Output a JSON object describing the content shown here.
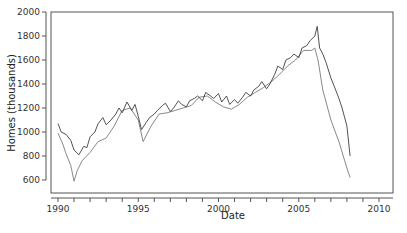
{
  "chart_data": {
    "type": "line",
    "title": "",
    "xlabel": "Date",
    "ylabel": "Homes (thousands)",
    "xlim": [
      1989.6,
      2010.9
    ],
    "ylim": [
      490,
      2000
    ],
    "grid": false,
    "legend": null,
    "x_ticks": [
      "1990",
      "1995",
      "2000",
      "2005",
      "2010"
    ],
    "y_ticks": [
      "600",
      "800",
      "1000",
      "1200",
      "1400",
      "1600",
      "1800",
      "2000"
    ],
    "series": [
      {
        "name": "series-dark",
        "color": "#404040",
        "x": [
          1990.0,
          1990.2,
          1990.5,
          1990.8,
          1991.0,
          1991.3,
          1991.6,
          1991.8,
          1992.0,
          1992.3,
          1992.5,
          1992.8,
          1993.0,
          1993.3,
          1993.6,
          1993.8,
          1994.0,
          1994.3,
          1994.6,
          1994.8,
          1995.0,
          1995.2,
          1995.5,
          1995.7,
          1996.0,
          1996.2,
          1996.5,
          1996.7,
          1997.0,
          1997.2,
          1997.5,
          1997.7,
          1998.0,
          1998.2,
          1998.5,
          1998.7,
          1999.0,
          1999.2,
          1999.5,
          1999.7,
          2000.0,
          2000.2,
          2000.5,
          2000.7,
          2001.0,
          2001.2,
          2001.5,
          2001.7,
          2002.0,
          2002.2,
          2002.5,
          2002.7,
          2003.0,
          2003.2,
          2003.5,
          2003.7,
          2004.0,
          2004.2,
          2004.5,
          2004.7,
          2005.0,
          2005.2,
          2005.5,
          2005.7,
          2006.0,
          2006.15,
          2006.3,
          2006.5,
          2006.7,
          2007.0,
          2007.3,
          2007.5,
          2007.7,
          2008.0,
          2008.2
        ],
        "values": [
          1070,
          1000,
          980,
          930,
          850,
          810,
          880,
          870,
          960,
          1000,
          1070,
          1120,
          1060,
          1100,
          1150,
          1200,
          1160,
          1250,
          1180,
          1230,
          1130,
          1020,
          1080,
          1120,
          1150,
          1180,
          1220,
          1240,
          1170,
          1200,
          1260,
          1230,
          1210,
          1260,
          1280,
          1300,
          1260,
          1330,
          1300,
          1280,
          1320,
          1250,
          1300,
          1230,
          1270,
          1240,
          1290,
          1330,
          1300,
          1350,
          1380,
          1420,
          1360,
          1400,
          1480,
          1550,
          1520,
          1600,
          1620,
          1650,
          1620,
          1700,
          1720,
          1760,
          1800,
          1880,
          1700,
          1650,
          1580,
          1450,
          1350,
          1280,
          1200,
          1050,
          800
        ]
      },
      {
        "name": "series-light",
        "color": "#7a7a7a",
        "x": [
          1990.0,
          1990.3,
          1990.5,
          1990.8,
          1991.0,
          1991.2,
          1991.5,
          1992.0,
          1992.5,
          1993.0,
          1993.5,
          1994.0,
          1994.5,
          1995.0,
          1995.3,
          1995.8,
          1996.3,
          1996.8,
          1997.3,
          1997.8,
          1998.3,
          1998.8,
          1999.3,
          1999.8,
          2000.3,
          2000.8,
          2001.3,
          2001.8,
          2002.3,
          2002.8,
          2003.3,
          2003.8,
          2004.3,
          2004.8,
          2005.3,
          2005.8,
          2006.0,
          2006.2,
          2006.5,
          2007.0,
          2007.5,
          2008.0,
          2008.2
        ],
        "values": [
          990,
          900,
          820,
          720,
          590,
          680,
          760,
          830,
          920,
          950,
          1050,
          1180,
          1200,
          1100,
          920,
          1050,
          1150,
          1160,
          1180,
          1200,
          1220,
          1290,
          1300,
          1250,
          1210,
          1190,
          1230,
          1290,
          1330,
          1370,
          1420,
          1480,
          1550,
          1600,
          1680,
          1680,
          1700,
          1600,
          1350,
          1100,
          920,
          700,
          620
        ]
      }
    ]
  }
}
